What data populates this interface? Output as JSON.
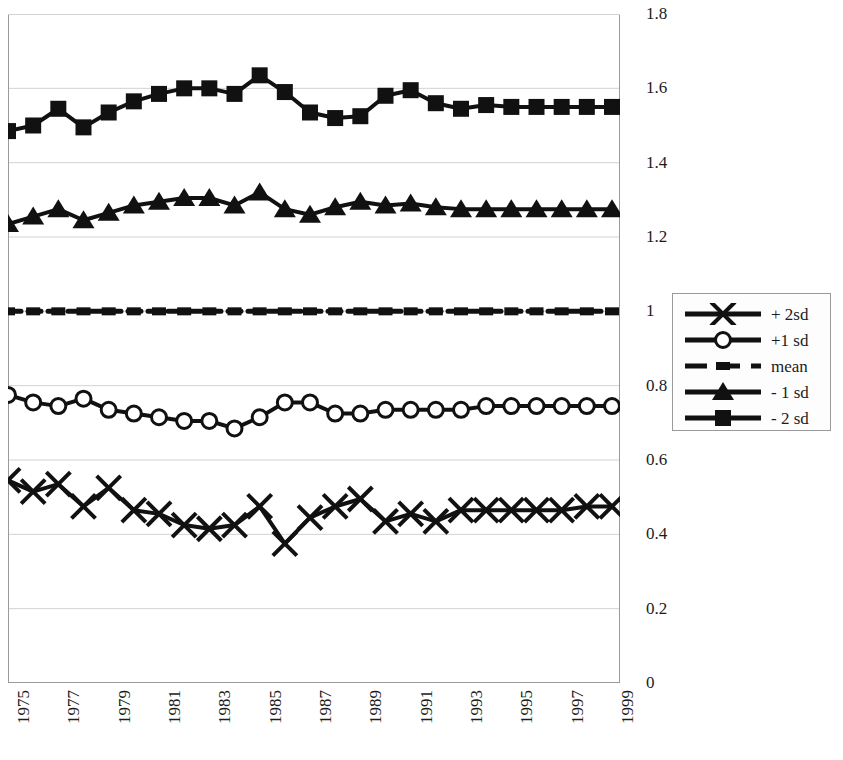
{
  "chart_data": {
    "type": "line",
    "title": "",
    "subtitle": "",
    "xlabel": "",
    "ylabel": "",
    "xlim": [
      1975,
      1999
    ],
    "ylim": [
      0,
      1.8
    ],
    "ytick_labels": [
      "1.8",
      "1.6",
      "1.4",
      "1.2",
      "1",
      "0.8",
      "0.6",
      "0.4",
      "0.2",
      "0"
    ],
    "ytick_values": [
      1.8,
      1.6,
      1.4,
      1.2,
      1.0,
      0.8,
      0.6,
      0.4,
      0.2,
      0.0
    ],
    "grid": true,
    "grid_axis": "y",
    "legend_position": "right",
    "x": [
      1975,
      1976,
      1977,
      1978,
      1979,
      1980,
      1981,
      1982,
      1983,
      1984,
      1985,
      1986,
      1987,
      1988,
      1989,
      1990,
      1991,
      1992,
      1993,
      1994,
      1995,
      1996,
      1997,
      1998,
      1999
    ],
    "xtick_labels": [
      "1975",
      "",
      "1977",
      "",
      "1979",
      "",
      "1981",
      "",
      "1983",
      "",
      "1985",
      "",
      "1987",
      "",
      "1989",
      "",
      "1991",
      "",
      "1993",
      "",
      "1995",
      "",
      "1997",
      "",
      "1999"
    ],
    "series": [
      {
        "name": "+ 2sd",
        "marker": "x",
        "color": "#111111",
        "values": [
          0.545,
          0.515,
          0.535,
          0.475,
          0.525,
          0.465,
          0.455,
          0.425,
          0.415,
          0.425,
          0.475,
          0.375,
          0.445,
          0.475,
          0.495,
          0.435,
          0.455,
          0.435,
          0.465,
          0.465,
          0.465,
          0.465,
          0.465,
          0.475,
          0.475
        ]
      },
      {
        "name": "+1 sd",
        "marker": "circle",
        "color": "#111111",
        "values": [
          0.775,
          0.755,
          0.745,
          0.765,
          0.735,
          0.725,
          0.715,
          0.705,
          0.705,
          0.685,
          0.715,
          0.755,
          0.755,
          0.725,
          0.725,
          0.735,
          0.735,
          0.735,
          0.735,
          0.745,
          0.745,
          0.745,
          0.745,
          0.745,
          0.745
        ]
      },
      {
        "name": "mean",
        "marker": "dash",
        "color": "#111111",
        "values": [
          1.0,
          1.0,
          1.0,
          1.0,
          1.0,
          1.0,
          1.0,
          1.0,
          1.0,
          1.0,
          1.0,
          1.0,
          1.0,
          1.0,
          1.0,
          1.0,
          1.0,
          1.0,
          1.0,
          1.0,
          1.0,
          1.0,
          1.0,
          1.0,
          1.0
        ]
      },
      {
        "name": "- 1 sd",
        "marker": "triangle",
        "color": "#111111",
        "values": [
          1.235,
          1.255,
          1.275,
          1.245,
          1.265,
          1.285,
          1.295,
          1.305,
          1.305,
          1.285,
          1.32,
          1.275,
          1.26,
          1.28,
          1.295,
          1.285,
          1.29,
          1.28,
          1.275,
          1.275,
          1.275,
          1.275,
          1.275,
          1.275,
          1.275
        ]
      },
      {
        "name": "- 2 sd",
        "marker": "square",
        "color": "#111111",
        "values": [
          1.485,
          1.5,
          1.545,
          1.495,
          1.535,
          1.565,
          1.585,
          1.6,
          1.6,
          1.585,
          1.635,
          1.59,
          1.535,
          1.52,
          1.525,
          1.58,
          1.595,
          1.56,
          1.545,
          1.555,
          1.55,
          1.55,
          1.55,
          1.55,
          1.55
        ]
      }
    ]
  },
  "legend": {
    "items": [
      {
        "label": "+ 2sd",
        "marker": "x"
      },
      {
        "label": "+1 sd",
        "marker": "circle"
      },
      {
        "label": "mean",
        "marker": "dash"
      },
      {
        "label": "- 1 sd",
        "marker": "triangle"
      },
      {
        "label": "- 2 sd",
        "marker": "square"
      }
    ]
  },
  "colors": {
    "series": "#111111",
    "grid": "#d2d2d2",
    "axis": "#9a9a9a",
    "text": "#1c1c1c",
    "legend_border": "#9a9a9a",
    "legend_bg": "#fdfdfd",
    "background": "#ffffff"
  }
}
